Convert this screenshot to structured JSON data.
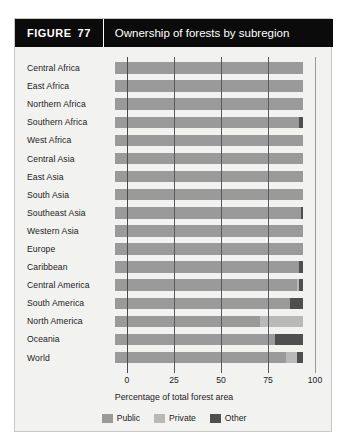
{
  "header": {
    "figure_word": "FIGURE",
    "figure_number": "77",
    "title": "Ownership of forests by subregion"
  },
  "chart_data": {
    "type": "bar",
    "orientation": "horizontal",
    "stacked": true,
    "title": "Ownership of forests by subregion",
    "xlabel": "Percentage of total forest area",
    "ylabel": "",
    "xlim": [
      0,
      100
    ],
    "xticks": [
      0,
      25,
      50,
      75,
      100
    ],
    "xtick_labels": [
      "0",
      "25",
      "50",
      "75",
      "100"
    ],
    "grid": true,
    "legend_position": "bottom",
    "categories": [
      "Central Africa",
      "East Africa",
      "Northern Africa",
      "Southern Africa",
      "West Africa",
      "Central Asia",
      "East Asia",
      "South Asia",
      "Southeast Asia",
      "Western Asia",
      "Europe",
      "Caribbean",
      "Central America",
      "South America",
      "North America",
      "Oceania",
      "World"
    ],
    "series": [
      {
        "name": "Public",
        "color": "#9a9a9a",
        "values": [
          100,
          100,
          100,
          98,
          100,
          100,
          100,
          100,
          99,
          100,
          100,
          98,
          97,
          93,
          77,
          85,
          91
        ]
      },
      {
        "name": "Private",
        "color": "#b9b9b9",
        "values": [
          0,
          0,
          0,
          0,
          0,
          0,
          0,
          0,
          0,
          0,
          0,
          0,
          1,
          0,
          23,
          0,
          6
        ]
      },
      {
        "name": "Other",
        "color": "#4f4f4f",
        "values": [
          0,
          0,
          0,
          2,
          0,
          0,
          0,
          0,
          1,
          0,
          0,
          2,
          2,
          7,
          0,
          15,
          3
        ]
      }
    ],
    "legend": [
      {
        "label": "Public",
        "color": "#9a9a9a"
      },
      {
        "label": "Private",
        "color": "#b9b9b9"
      },
      {
        "label": "Other",
        "color": "#4f4f4f"
      }
    ]
  }
}
